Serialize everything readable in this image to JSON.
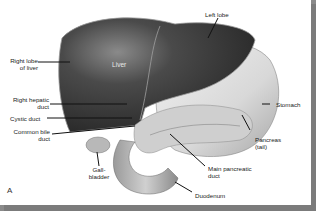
{
  "figure": {
    "panel_letter": "A"
  },
  "labels": {
    "liver": "Liver",
    "left_lobe": "Left lobe",
    "right_lobe_1": "Right lobe",
    "right_lobe_2": "of liver",
    "right_hepatic_1": "Right hepatic",
    "right_hepatic_2": "duct",
    "cystic_duct": "Cystic duct",
    "common_bile_1": "Common bile",
    "common_bile_2": "duct",
    "gallbladder_1": "Gall-",
    "gallbladder_2": "bladder",
    "stomach": "Stomach",
    "pancreas_1": "Pancreas",
    "pancreas_2": "(tail)",
    "main_pancreatic_1": "Main pancreatic",
    "main_pancreatic_2": "duct",
    "duodenum": "Duodenum"
  },
  "colors": {
    "liver": "#3c3c3c",
    "stomach": "#d9d9d9",
    "pancreas": "#c8c8c8",
    "border": "#7b7b7b"
  }
}
